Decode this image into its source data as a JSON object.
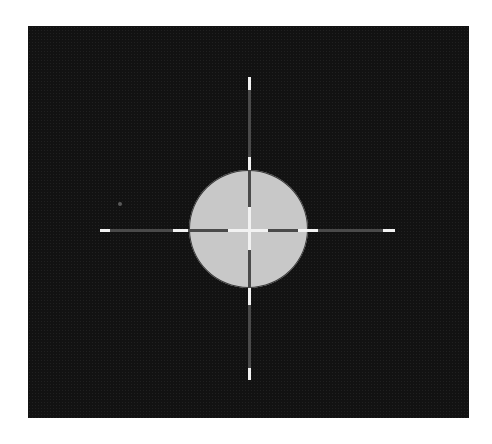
{
  "image": {
    "description": "Binarized image of a light gray disc centered on a dark noisy background with crosshair lines",
    "colors": {
      "background": "#121212",
      "disc": "#c8c8c8",
      "crosshair_dark": "#4a4a4a",
      "crosshair_bright": "#f2f2f2",
      "page": "#ffffff"
    },
    "crosshair": {
      "center": [
        249,
        230
      ],
      "horizontal_bright_segments": [
        [
          100,
          110
        ],
        [
          173,
          188
        ],
        [
          228,
          268
        ],
        [
          298,
          318
        ],
        [
          383,
          395
        ]
      ],
      "vertical_bright_segments": [
        [
          77,
          90
        ],
        [
          157,
          170
        ],
        [
          207,
          250
        ],
        [
          288,
          305
        ],
        [
          368,
          380
        ]
      ]
    }
  }
}
